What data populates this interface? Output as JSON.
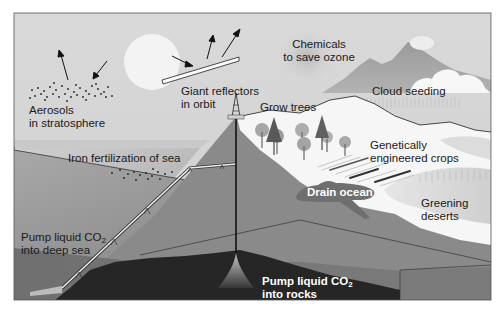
{
  "colors": {
    "sky": "#d4d4d4",
    "sun": "#f2f2f2",
    "sea_surface": "#bdbdbd",
    "deep_sea": "#8c8c8c",
    "land": "#f5f5f5",
    "crust": "#7a7a7a",
    "rock": "#262626",
    "frame": "#555555"
  },
  "labels": {
    "aerosols": {
      "line1": "Aerosols",
      "line2": "in stratosphere"
    },
    "reflectors": {
      "line1": "Giant reflectors",
      "line2": "in orbit"
    },
    "ozone": {
      "line1": "Chemicals",
      "line2": "to save ozone"
    },
    "cloud_seeding": "Cloud seeding",
    "grow_trees": "Grow trees",
    "gm_crops": {
      "line1": "Genetically",
      "line2": "engineered crops"
    },
    "iron_fertilization": "Iron fertilization of sea",
    "drain_ocean": "Drain ocean",
    "greening_deserts": {
      "line1": "Greening",
      "line2": "deserts"
    },
    "pump_deep_sea": {
      "line1_prefix": "Pump liquid CO",
      "line1_sub": "2",
      "line2": "into deep sea"
    },
    "pump_rocks": {
      "line1_prefix": "Pump liquid CO",
      "line1_sub": "2",
      "line2": "into rocks"
    }
  }
}
